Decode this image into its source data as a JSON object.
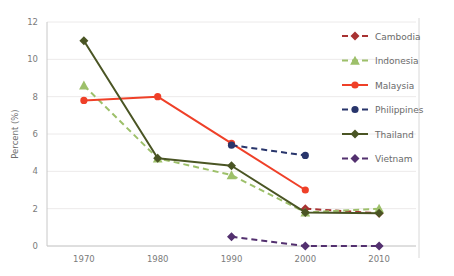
{
  "chart_data": {
    "type": "line",
    "title": "",
    "xlabel": "",
    "ylabel": "Percent (%)",
    "x": [
      1970,
      1980,
      1990,
      2000,
      2010
    ],
    "xtick_labels": [
      "1970",
      "1980",
      "1990",
      "2000",
      "2010"
    ],
    "ytick_labels": [
      "0",
      "2",
      "4",
      "6",
      "8",
      "10",
      "12"
    ],
    "yticks": [
      0,
      2,
      4,
      6,
      8,
      10,
      12
    ],
    "ylim": [
      0,
      12
    ],
    "xlim": [
      1965,
      2015
    ],
    "grid": "horizontal",
    "legend_position": "right",
    "series": [
      {
        "name": "Cambodia",
        "color": "#a83232",
        "style": "dashed",
        "marker": "diamond",
        "x": [
          2000,
          2010
        ],
        "values": [
          2.0,
          1.75
        ]
      },
      {
        "name": "Indonesia",
        "color": "#9dc06a",
        "style": "dashed",
        "marker": "triangle",
        "x": [
          1970,
          1980,
          1990,
          2000,
          2010
        ],
        "values": [
          8.6,
          4.7,
          3.8,
          1.8,
          2.0
        ]
      },
      {
        "name": "Malaysia",
        "color": "#ef4028",
        "style": "solid",
        "marker": "circle",
        "x": [
          1970,
          1980,
          1990,
          2000
        ],
        "values": [
          7.8,
          8.0,
          5.5,
          3.0
        ]
      },
      {
        "name": "Philippines",
        "color": "#28356b",
        "style": "dashed",
        "marker": "circle",
        "x": [
          1990,
          2000
        ],
        "values": [
          5.4,
          4.85
        ]
      },
      {
        "name": "Thailand",
        "color": "#4a5524",
        "style": "solid",
        "marker": "diamond",
        "x": [
          1970,
          1980,
          1990,
          2000,
          2010
        ],
        "values": [
          11.0,
          4.7,
          4.3,
          1.8,
          1.75
        ]
      },
      {
        "name": "Vietnam",
        "color": "#53306f",
        "style": "dashed",
        "marker": "diamond",
        "x": [
          1990,
          2000,
          2010
        ],
        "values": [
          0.5,
          0.0,
          0.0
        ]
      }
    ]
  },
  "legend": {
    "items": [
      {
        "label": "Cambodia"
      },
      {
        "label": "Indonesia"
      },
      {
        "label": "Malaysia"
      },
      {
        "label": "Philippines"
      },
      {
        "label": "Thailand"
      },
      {
        "label": "Vietnam"
      }
    ]
  }
}
